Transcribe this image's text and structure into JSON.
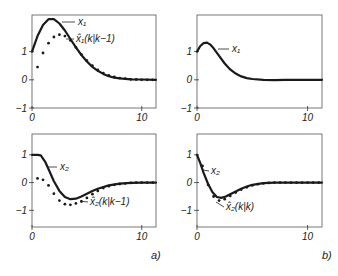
{
  "chart_data": [
    {
      "id": "a_top",
      "type": "line",
      "panel": "a)",
      "frame": {
        "x0": 32,
        "x1": 156,
        "y_top": 15,
        "y_bottom": 108
      },
      "xlim": [
        0,
        11.3
      ],
      "ylim": [
        -1,
        2.3
      ],
      "xticks": [
        0,
        10
      ],
      "yticks": [
        -1,
        0,
        1
      ],
      "xtick_labels": [
        "0",
        "10"
      ],
      "ytick_labels": [
        "-1",
        "0",
        "1"
      ],
      "grid": false,
      "series": [
        {
          "name": "x1",
          "label": "x₁",
          "style": "solid",
          "x": [
            0,
            0.5,
            1,
            1.5,
            2,
            2.5,
            3,
            3.5,
            4,
            4.5,
            5,
            5.5,
            6,
            6.5,
            7,
            7.5,
            8,
            9,
            10,
            11.3
          ],
          "y": [
            1.0,
            1.55,
            1.95,
            2.15,
            2.15,
            2.0,
            1.75,
            1.45,
            1.15,
            0.88,
            0.65,
            0.46,
            0.32,
            0.21,
            0.13,
            0.08,
            0.05,
            0.02,
            0.01,
            0.0
          ]
        },
        {
          "name": "x1_hat_pred",
          "label": "x̂₁(k|k−1)",
          "style": "dots",
          "x": [
            0.5,
            1,
            1.5,
            2,
            2.5,
            3,
            3.5,
            4,
            4.5,
            5,
            5.5,
            6,
            6.5,
            7,
            7.5,
            8,
            8.5,
            9,
            9.5,
            10,
            10.5,
            11
          ],
          "y": [
            0.45,
            0.95,
            1.3,
            1.52,
            1.6,
            1.55,
            1.4,
            1.15,
            0.9,
            0.68,
            0.5,
            0.35,
            0.24,
            0.16,
            0.1,
            0.06,
            0.04,
            0.02,
            0.01,
            0.0,
            0.0,
            0.0
          ]
        }
      ],
      "annotations": [
        {
          "text": "x₁",
          "tx": 78,
          "ty": 25,
          "lx1": 62,
          "ly1": 22,
          "lx2": 75,
          "ly2": 22
        },
        {
          "text": "x̂₁(k|k−1)",
          "tx": 76,
          "ty": 42,
          "lx1": 66,
          "ly1": 39,
          "lx2": 74,
          "ly2": 39
        }
      ]
    },
    {
      "id": "a_bottom",
      "type": "line",
      "panel": "a)",
      "frame": {
        "x0": 32,
        "x1": 156,
        "y_top": 134,
        "y_bottom": 227
      },
      "xlim": [
        0,
        11.3
      ],
      "ylim": [
        -1.6,
        1.75
      ],
      "xticks": [
        0,
        10
      ],
      "yticks": [
        -1,
        0,
        1
      ],
      "xtick_labels": [
        "0",
        "10"
      ],
      "ytick_labels": [
        "-1",
        "0",
        "1"
      ],
      "grid": false,
      "series": [
        {
          "name": "x2",
          "label": "x₂",
          "style": "solid",
          "x": [
            0,
            0.5,
            0.8,
            1.2,
            1.6,
            2,
            2.5,
            3,
            3.5,
            4,
            4.5,
            5,
            5.5,
            6,
            7,
            8,
            9,
            10,
            11.3
          ],
          "y": [
            1.0,
            1.0,
            0.98,
            0.75,
            0.4,
            0.05,
            -0.3,
            -0.52,
            -0.6,
            -0.58,
            -0.5,
            -0.4,
            -0.3,
            -0.22,
            -0.1,
            -0.04,
            -0.01,
            0.0,
            0.0
          ]
        },
        {
          "name": "x2_hat_pred",
          "label": "x̂₂(k|k−1)",
          "style": "dots",
          "x": [
            0.5,
            1,
            1.5,
            2,
            2.5,
            3,
            3.5,
            4,
            4.5,
            5,
            5.5,
            6,
            6.5,
            7,
            7.5,
            8,
            8.5,
            9,
            9.5,
            10,
            10.5,
            11
          ],
          "y": [
            0.15,
            0.1,
            -0.1,
            -0.4,
            -0.65,
            -0.78,
            -0.8,
            -0.75,
            -0.68,
            -0.55,
            -0.42,
            -0.3,
            -0.2,
            -0.13,
            -0.08,
            -0.05,
            -0.03,
            -0.01,
            0.0,
            0.0,
            0.0,
            0.0
          ]
        }
      ],
      "annotations": [
        {
          "text": "x₂",
          "tx": 60,
          "ty": 170,
          "lx1": 48,
          "ly1": 167,
          "lx2": 57,
          "ly2": 167
        },
        {
          "text": "x̂₂(k|k−1)",
          "tx": 90,
          "ty": 205,
          "lx1": 80,
          "ly1": 201,
          "lx2": 88,
          "ly2": 202
        }
      ]
    },
    {
      "id": "b_top",
      "type": "line",
      "panel": "b)",
      "frame": {
        "x0": 197,
        "x1": 322,
        "y_top": 15,
        "y_bottom": 108
      },
      "xlim": [
        0,
        11.3
      ],
      "ylim": [
        -1,
        2.3
      ],
      "xticks": [
        0,
        10
      ],
      "yticks": [
        -1,
        0,
        1
      ],
      "xtick_labels": [
        "0",
        "10"
      ],
      "ytick_labels": [
        "-1",
        "0",
        "1"
      ],
      "grid": false,
      "series": [
        {
          "name": "x1",
          "label": "x₁",
          "style": "solid",
          "x": [
            0,
            0.3,
            0.6,
            0.9,
            1.2,
            1.5,
            2,
            2.5,
            3,
            3.5,
            4,
            4.5,
            5,
            6,
            7,
            8,
            9,
            10,
            11.3
          ],
          "y": [
            1.0,
            1.2,
            1.3,
            1.32,
            1.25,
            1.12,
            0.85,
            0.58,
            0.37,
            0.22,
            0.12,
            0.06,
            0.03,
            0.0,
            -0.01,
            0.0,
            0.0,
            0.0,
            0.0
          ]
        }
      ],
      "annotations": [
        {
          "text": "x₁",
          "tx": 232,
          "ty": 52,
          "lx1": 218,
          "ly1": 49,
          "lx2": 229,
          "ly2": 49
        }
      ]
    },
    {
      "id": "b_bottom",
      "type": "line",
      "panel": "b)",
      "frame": {
        "x0": 197,
        "x1": 322,
        "y_top": 134,
        "y_bottom": 227
      },
      "xlim": [
        0,
        11.3
      ],
      "ylim": [
        -1.6,
        1.75
      ],
      "xticks": [
        0,
        10
      ],
      "yticks": [
        -1,
        0,
        1
      ],
      "xtick_labels": [
        "0",
        "10"
      ],
      "ytick_labels": [
        "-1",
        "0",
        "1"
      ],
      "grid": false,
      "series": [
        {
          "name": "x2",
          "label": "x₂",
          "style": "solid",
          "x": [
            0,
            0.3,
            0.6,
            1,
            1.4,
            1.8,
            2.2,
            2.6,
            3,
            3.5,
            4,
            4.5,
            5,
            6,
            7,
            8,
            9,
            10,
            11.3
          ],
          "y": [
            1.0,
            0.7,
            0.35,
            -0.05,
            -0.35,
            -0.52,
            -0.55,
            -0.5,
            -0.42,
            -0.32,
            -0.22,
            -0.14,
            -0.08,
            -0.02,
            0.0,
            0.0,
            0.0,
            0.0,
            0.0
          ]
        },
        {
          "name": "x2_hat_filt",
          "label": "x̂₂(k|k)",
          "style": "dots",
          "x": [
            0.5,
            1,
            1.5,
            2,
            2.5,
            3,
            3.5,
            4,
            4.5,
            5,
            5.5,
            6,
            6.5,
            7,
            7.5,
            8,
            8.5,
            9,
            9.5,
            10,
            10.5,
            11
          ],
          "y": [
            0.6,
            -0.08,
            -0.5,
            -0.65,
            -0.6,
            -0.48,
            -0.36,
            -0.25,
            -0.17,
            -0.1,
            -0.06,
            -0.03,
            -0.01,
            0.0,
            0.0,
            0.0,
            0.0,
            0.0,
            0.0,
            0.0,
            0.0,
            0.0
          ]
        }
      ],
      "annotations": [
        {
          "text": "x₂",
          "tx": 211,
          "ty": 174,
          "lx1": 203,
          "ly1": 170,
          "lx2": 209,
          "ly2": 171
        },
        {
          "text": "x̂₂(k|k)",
          "tx": 226,
          "ty": 210,
          "lx1": 216,
          "ly1": 202,
          "lx2": 224,
          "ly2": 207
        }
      ]
    }
  ],
  "panel_labels": {
    "a": "a)",
    "b": "b)"
  }
}
